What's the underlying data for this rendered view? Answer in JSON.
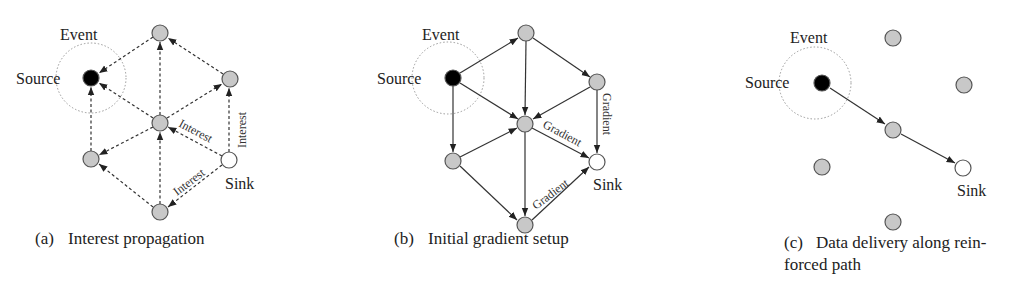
{
  "colors": {
    "node_fill": "#c8c8c8",
    "node_stroke": "#555555",
    "source_fill": "#000000",
    "sink_fill": "#ffffff",
    "edge": "#333333",
    "event_circle": "#888888"
  },
  "panels": [
    {
      "id": "a",
      "caption_tag": "(a)",
      "caption": "Interest propagation",
      "edge_style": "dashed",
      "labels": {
        "event": "Event",
        "source": "Source",
        "sink": "Sink"
      },
      "edge_labels": [
        "Interest",
        "Interest",
        "Interest"
      ]
    },
    {
      "id": "b",
      "caption_tag": "(b)",
      "caption": "Initial gradient setup",
      "edge_style": "solid",
      "labels": {
        "event": "Event",
        "source": "Source",
        "sink": "Sink"
      },
      "edge_labels": [
        "Gradient",
        "Gradient",
        "Gradient"
      ]
    },
    {
      "id": "c",
      "caption_tag": "(c)",
      "caption_line1": "Data delivery along rein-",
      "caption_line2": "forced path",
      "edge_style": "solid",
      "labels": {
        "event": "Event",
        "source": "Source",
        "sink": "Sink"
      }
    }
  ]
}
